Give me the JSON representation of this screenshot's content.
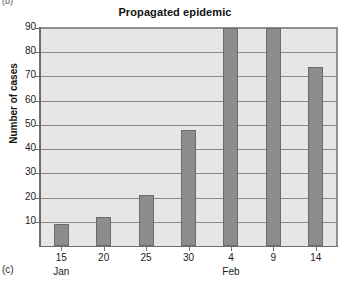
{
  "panel": {
    "top_letter": "(b)",
    "bottom_letter": "(c)"
  },
  "chart_data": {
    "type": "bar",
    "title": "Propagated epidemic",
    "xlabel": "",
    "ylabel": "Number of cases",
    "categories": [
      "15",
      "20",
      "25",
      "30",
      "4",
      "9",
      "14"
    ],
    "month_labels": [
      {
        "category": "15",
        "label": "Jan"
      },
      {
        "category": "4",
        "label": "Feb"
      }
    ],
    "values": [
      9,
      12,
      21,
      48,
      90,
      90,
      74
    ],
    "ylim": [
      0,
      90
    ],
    "yticks": [
      10,
      20,
      30,
      40,
      50,
      60,
      70,
      80,
      90
    ],
    "ytick_labels": [
      "10",
      "20",
      "30",
      "40",
      "50",
      "60",
      "70",
      "80",
      "90"
    ],
    "grid": true,
    "legend": "none",
    "bar_color": "#8c8c8c",
    "bar_edge_color": "#6b6b6b",
    "plot_background": "#e6e6e6",
    "gridline_color": "#8a8a8a",
    "axis_color": "#6e6e6e"
  }
}
